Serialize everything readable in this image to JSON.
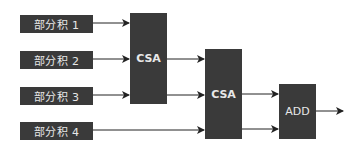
{
  "diagram": {
    "inputs": [
      {
        "label": "部分积 1"
      },
      {
        "label": "部分积 2"
      },
      {
        "label": "部分积 3"
      },
      {
        "label": "部分积 4"
      }
    ],
    "blocks": {
      "csa1": {
        "label": "CSA"
      },
      "csa2": {
        "label": "CSA"
      },
      "add": {
        "label": "ADD"
      }
    },
    "colors": {
      "block_fill": "#3a3a3a",
      "text": "#e8e8e8",
      "wire": "#222222"
    }
  }
}
